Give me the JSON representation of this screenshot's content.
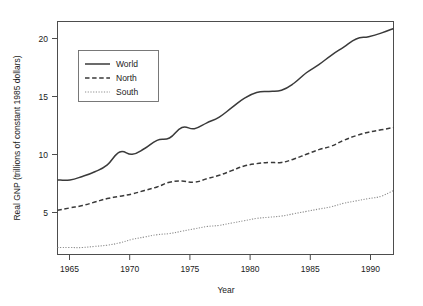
{
  "chart_data": {
    "type": "line",
    "title": "",
    "xlabel": "Year",
    "ylabel": "Real GNP (trillions of constant 1985 dollars)",
    "xlim": [
      1965,
      1992
    ],
    "ylim": [
      1.6,
      21.6
    ],
    "xticks": [
      1965,
      1970,
      1975,
      1980,
      1985,
      1990
    ],
    "yticks": [
      5,
      10,
      15,
      20
    ],
    "grid": false,
    "legend_position": "upper-left-inside",
    "x": [
      1965,
      1966,
      1967,
      1968,
      1969,
      1970,
      1971,
      1972,
      1973,
      1974,
      1975,
      1976,
      1977,
      1978,
      1979,
      1980,
      1981,
      1982,
      1983,
      1984,
      1985,
      1986,
      1987,
      1988,
      1989,
      1990,
      1991,
      1992
    ],
    "series": [
      {
        "name": "World",
        "style": "solid",
        "values": [
          8.0,
          8.0,
          8.3,
          8.7,
          9.3,
          10.4,
          10.2,
          10.7,
          11.4,
          11.6,
          12.5,
          12.4,
          12.9,
          13.4,
          14.2,
          15.0,
          15.5,
          15.6,
          15.7,
          16.3,
          17.2,
          17.9,
          18.7,
          19.4,
          20.1,
          20.3,
          20.6,
          21.0
        ]
      },
      {
        "name": "North",
        "style": "dashed",
        "values": [
          5.4,
          5.6,
          5.8,
          6.1,
          6.4,
          6.6,
          6.8,
          7.1,
          7.4,
          7.8,
          7.9,
          7.8,
          8.1,
          8.4,
          8.8,
          9.2,
          9.4,
          9.5,
          9.5,
          9.8,
          10.2,
          10.6,
          10.9,
          11.4,
          11.8,
          12.1,
          12.3,
          12.5
        ]
      },
      {
        "name": "South",
        "style": "dotted",
        "values": [
          2.2,
          2.2,
          2.2,
          2.3,
          2.4,
          2.6,
          2.9,
          3.1,
          3.3,
          3.4,
          3.6,
          3.8,
          4.0,
          4.1,
          4.3,
          4.5,
          4.7,
          4.8,
          4.9,
          5.1,
          5.3,
          5.5,
          5.7,
          6.0,
          6.2,
          6.4,
          6.6,
          7.1
        ]
      }
    ]
  },
  "legend": {
    "items": [
      {
        "label": "World"
      },
      {
        "label": "North"
      },
      {
        "label": "South"
      }
    ]
  },
  "colors": {
    "world": "#3a3a3a",
    "north": "#3a3a3a",
    "south": "#8e8e8e",
    "frame": "#4d4d4d",
    "text": "#1a1a1a",
    "background": "#ffffff"
  }
}
